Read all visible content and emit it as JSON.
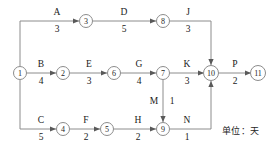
{
  "diagram": {
    "type": "activity-on-arrow-network",
    "unit_note": "单位：天",
    "nodes": [
      {
        "id": "1",
        "label": "1",
        "x": 20,
        "y": 73
      },
      {
        "id": "2",
        "label": "2",
        "x": 63,
        "y": 73
      },
      {
        "id": "3",
        "label": "3",
        "x": 86,
        "y": 21
      },
      {
        "id": "4",
        "label": "4",
        "x": 63,
        "y": 129
      },
      {
        "id": "5",
        "label": "5",
        "x": 107,
        "y": 129
      },
      {
        "id": "6",
        "label": "6",
        "x": 114,
        "y": 73
      },
      {
        "id": "7",
        "label": "7",
        "x": 163,
        "y": 73
      },
      {
        "id": "8",
        "label": "8",
        "x": 163,
        "y": 21
      },
      {
        "id": "9",
        "label": "9",
        "x": 163,
        "y": 129
      },
      {
        "id": "10",
        "label": "10",
        "x": 211,
        "y": 73
      },
      {
        "id": "11",
        "label": "11",
        "x": 258,
        "y": 73
      }
    ],
    "activities": [
      {
        "name": "A",
        "duration": "3",
        "from": "1",
        "to": "3",
        "label_x": 57,
        "label_y": 21
      },
      {
        "name": "D",
        "duration": "5",
        "from": "3",
        "to": "8",
        "label_x": 124,
        "label_y": 21
      },
      {
        "name": "J",
        "duration": "3",
        "from": "8",
        "to": "10",
        "label_x": 188,
        "label_y": 21
      },
      {
        "name": "B",
        "duration": "4",
        "from": "1",
        "to": "2",
        "label_x": 41,
        "label_y": 73
      },
      {
        "name": "E",
        "duration": "3",
        "from": "2",
        "to": "6",
        "label_x": 89,
        "label_y": 73
      },
      {
        "name": "G",
        "duration": "4",
        "from": "6",
        "to": "7",
        "label_x": 139,
        "label_y": 73
      },
      {
        "name": "K",
        "duration": "3",
        "from": "7",
        "to": "10",
        "label_x": 187,
        "label_y": 73
      },
      {
        "name": "P",
        "duration": "2",
        "from": "10",
        "to": "11",
        "label_x": 235,
        "label_y": 73
      },
      {
        "name": "C",
        "duration": "5",
        "from": "1",
        "to": "4",
        "label_x": 41,
        "label_y": 129
      },
      {
        "name": "F",
        "duration": "2",
        "from": "4",
        "to": "5",
        "label_x": 86,
        "label_y": 129
      },
      {
        "name": "H",
        "duration": "2",
        "from": "5",
        "to": "9",
        "label_x": 138,
        "label_y": 129
      },
      {
        "name": "N",
        "duration": "1",
        "from": "9",
        "to": "10",
        "label_x": 187,
        "label_y": 129
      },
      {
        "name": "M",
        "duration": "1",
        "from": "7",
        "to": "9",
        "label_x": 155,
        "label_y": 101
      }
    ],
    "colors": {
      "line": "#8c8c8c",
      "node_stroke": "#8c8c8c",
      "text": "#1a1a1a",
      "background": "#ffffff"
    }
  }
}
